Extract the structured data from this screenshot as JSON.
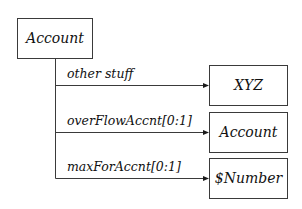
{
  "diagram": {
    "type": "tree",
    "root": {
      "label": "Account"
    },
    "edges": [
      {
        "label": "other stuff",
        "target": "XYZ"
      },
      {
        "label": "overFlowAccnt[0:1]",
        "target": "Account"
      },
      {
        "label": "maxForAccnt[0:1]",
        "target": "$Number"
      }
    ],
    "colors": {
      "stroke": "#3a3a3a",
      "text": "#111111",
      "background": "#ffffff"
    }
  }
}
